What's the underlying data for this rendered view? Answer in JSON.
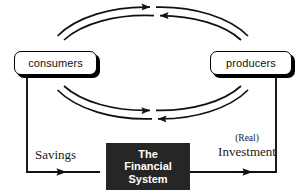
{
  "diagram": {
    "canvas": {
      "width": 305,
      "height": 195,
      "background": "#ffffff"
    },
    "nodes": {
      "consumers": {
        "label": "consumers",
        "shape": "rounded-rectangle",
        "fill": "#ffffff",
        "stroke": "#000000",
        "shadow": "#000000"
      },
      "producers": {
        "label": "producers",
        "shape": "rounded-rectangle",
        "fill": "#ffffff",
        "stroke": "#000000",
        "shadow": "#000000"
      },
      "financial_system": {
        "line1": "The",
        "line2": "Financial",
        "line3": "System",
        "shape": "rectangle",
        "fill": "#262626",
        "text_color": "#ffffff"
      }
    },
    "flow_labels": {
      "savings": "Savings",
      "investment_qualifier": "(Real)",
      "investment": "Investment"
    },
    "connectors": {
      "ellipse_outer_top": {
        "name": "outer-ellipse-top-arc",
        "direction": "consumers-to-producers",
        "arrow": "right"
      },
      "ellipse_inner_top": {
        "name": "inner-ellipse-top-arc",
        "direction": "producers-to-consumers",
        "arrow": "left"
      },
      "ellipse_inner_bottom": {
        "name": "inner-ellipse-bottom-arc",
        "direction": "consumers-to-producers",
        "arrow": "right"
      },
      "ellipse_outer_bottom": {
        "name": "outer-ellipse-bottom-arc",
        "direction": "producers-to-consumers",
        "arrow": "left"
      },
      "savings_path": {
        "name": "savings-path",
        "direction": "consumers-to-financial-system",
        "arrow": "right"
      },
      "investment_path": {
        "name": "investment-path",
        "direction": "financial-system-to-producers",
        "arrow": "right"
      }
    },
    "geometry": {
      "ellipse_center_x": 153,
      "ellipse_center_y": 63,
      "ellipse_outer_rx": 100,
      "ellipse_outer_ry": 56,
      "ellipse_inner_rx": 93,
      "ellipse_inner_ry": 48,
      "stroke_color": "#111111",
      "stroke_width": 1.7
    }
  }
}
